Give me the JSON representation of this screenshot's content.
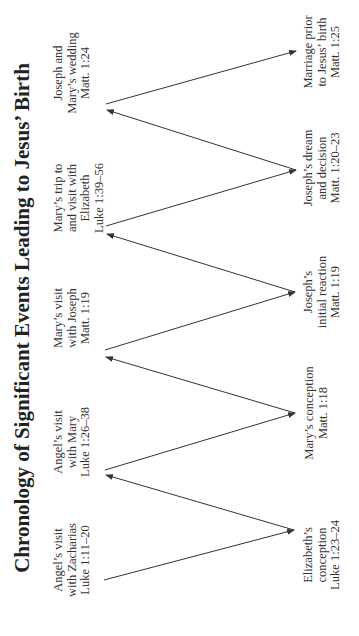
{
  "title": "Chronology of Significant Events Leading to Jesus’ Birth",
  "top_events": [
    {
      "lines": [
        "Angel’s visit",
        "with Zacharias",
        "Luke 1:11–20"
      ]
    },
    {
      "lines": [
        "Angel’s visit",
        "with Mary",
        "Luke 1:26–38"
      ]
    },
    {
      "lines": [
        "Mary’s visit",
        "with Joseph",
        "Matt. 1:19"
      ]
    },
    {
      "lines": [
        "Mary’s trip to",
        "and visit with",
        "Elizabeth",
        "Luke 1:39–56"
      ]
    },
    {
      "lines": [
        "Joseph and",
        "Mary’s wedding",
        "Matt. 1:24"
      ]
    }
  ],
  "bottom_events": [
    {
      "lines": [
        "Elizabeth’s",
        "conception",
        "Luke 1:23–24"
      ]
    },
    {
      "lines": [
        "Mary’s conception",
        "Matt. 1:18"
      ]
    },
    {
      "lines": [
        "Joseph’s",
        "initial reaction",
        "Matt. 1:19"
      ]
    },
    {
      "lines": [
        "Joseph’s dream",
        "and decision",
        "Matt. 1:20–23"
      ]
    },
    {
      "lines": [
        "Marriage prior",
        "to Jesus’ birth",
        "Matt. 1:25"
      ]
    }
  ],
  "colors": {
    "line": "#333333",
    "text": "#333333"
  }
}
